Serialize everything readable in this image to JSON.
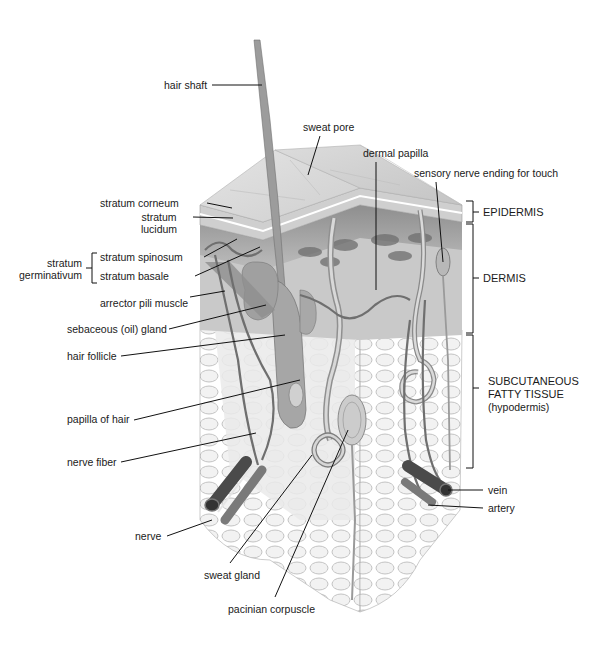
{
  "figure": {
    "type": "anatomical cross-section",
    "colors": {
      "background": "#ffffff",
      "skin_surface": "#d9d9d9",
      "epidermis_layers": "#c8c8c8",
      "dermis": "#a8a8a8",
      "hypodermis_fat": "#e6e6e6",
      "vessel_dark": "#4a4a4a",
      "vessel_mid": "#7a7a7a",
      "label_text": "#1a1a1a",
      "leader_line": "#111111"
    }
  },
  "labels": {
    "hair_shaft": "hair shaft",
    "sweat_pore": "sweat pore",
    "dermal_papilla": "dermal papilla",
    "sensory_nerve": "sensory nerve ending for touch",
    "stratum_corneum": "stratum corneum",
    "stratum_lucidum_1": "stratum",
    "stratum_lucidum_2": "lucidum",
    "stratum_germinativum_1": "stratum",
    "stratum_germinativum_2": "germinativum",
    "stratum_spinosum": "stratum spinosum",
    "stratum_basale": "stratum basale",
    "arrector_pili": "arrector pili muscle",
    "sebaceous_gland": "sebaceous (oil) gland",
    "hair_follicle": "hair follicle",
    "papilla_of_hair": "papilla of hair",
    "nerve_fiber": "nerve fiber",
    "nerve": "nerve",
    "sweat_gland": "sweat gland",
    "pacinian_corpuscle": "pacinian corpuscle",
    "vein": "vein",
    "artery": "artery"
  },
  "regions": {
    "epidermis": "EPIDERMIS",
    "dermis": "DERMIS",
    "subcutaneous_1": "SUBCUTANEOUS",
    "subcutaneous_2": "FATTY TISSUE",
    "subcutaneous_3": "(hypodermis)"
  }
}
